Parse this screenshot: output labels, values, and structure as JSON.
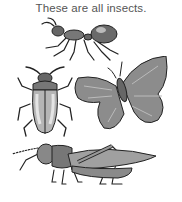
{
  "caption": "These are all insects.",
  "illustrations": [
    {
      "name": "ant",
      "icon": "ant-icon"
    },
    {
      "name": "beetle",
      "icon": "beetle-icon"
    },
    {
      "name": "butterfly",
      "icon": "butterfly-icon"
    },
    {
      "name": "grasshopper",
      "icon": "grasshopper-icon"
    }
  ],
  "colors": {
    "text": "#555555",
    "ink": "#222222",
    "body": "#8a8a8a",
    "light": "#c8c8c8"
  }
}
